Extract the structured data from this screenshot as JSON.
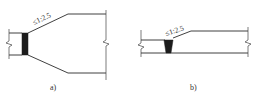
{
  "figure": {
    "panels": [
      {
        "id": "a",
        "label": "a)",
        "slope_annotation": "≤1:2.5",
        "description": "Transition widening from narrow to wide section with black joint block"
      },
      {
        "id": "b",
        "label": "b)",
        "slope_annotation": "≤1:2.5",
        "description": "Transition in thickness with wedge-shaped black joint"
      }
    ],
    "colors": {
      "line": "#2a2a2a",
      "fill": "#1c1c1c",
      "background": "#ffffff"
    }
  }
}
